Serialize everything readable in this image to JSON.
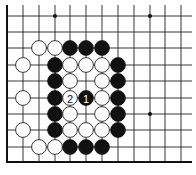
{
  "board": {
    "title": "Go problem diagram",
    "colors": {
      "black": "#111111",
      "white": "#ffffff",
      "line": "#222222",
      "background": "#ffffff"
    },
    "columns_x": [
      7,
      23,
      39,
      55,
      70,
      86,
      102,
      118,
      134,
      150,
      165,
      181
    ],
    "rows_y": [
      16,
      32,
      48,
      65,
      81,
      98,
      114,
      130,
      147
    ],
    "edges": {
      "left": true,
      "bottom": true,
      "top": false,
      "right": false
    },
    "star_points": [
      {
        "col": 3,
        "row": 0
      },
      {
        "col": 9,
        "row": 0
      },
      {
        "col": 9,
        "row": 6
      }
    ],
    "stones": [
      {
        "color": "white",
        "col": 2,
        "row": 2
      },
      {
        "color": "white",
        "col": 3,
        "row": 2
      },
      {
        "color": "black",
        "col": 4,
        "row": 2
      },
      {
        "color": "black",
        "col": 5,
        "row": 2
      },
      {
        "color": "black",
        "col": 6,
        "row": 2
      },
      {
        "color": "white",
        "col": 1,
        "row": 3
      },
      {
        "color": "black",
        "col": 3,
        "row": 3
      },
      {
        "color": "white",
        "col": 4,
        "row": 3
      },
      {
        "color": "white",
        "col": 5,
        "row": 3
      },
      {
        "color": "white",
        "col": 6,
        "row": 3
      },
      {
        "color": "black",
        "col": 7,
        "row": 3
      },
      {
        "color": "black",
        "col": 3,
        "row": 4
      },
      {
        "color": "white",
        "col": 4,
        "row": 4
      },
      {
        "color": "white",
        "col": 6,
        "row": 4
      },
      {
        "color": "black",
        "col": 7,
        "row": 4
      },
      {
        "color": "white",
        "col": 1,
        "row": 5
      },
      {
        "color": "black",
        "col": 3,
        "row": 5
      },
      {
        "color": "white",
        "col": 4,
        "row": 5,
        "label": "2"
      },
      {
        "color": "black",
        "col": 5,
        "row": 5,
        "label": "1"
      },
      {
        "color": "white",
        "col": 6,
        "row": 5
      },
      {
        "color": "black",
        "col": 7,
        "row": 5
      },
      {
        "color": "black",
        "col": 3,
        "row": 6
      },
      {
        "color": "white",
        "col": 4,
        "row": 6
      },
      {
        "color": "white",
        "col": 6,
        "row": 6
      },
      {
        "color": "black",
        "col": 7,
        "row": 6
      },
      {
        "color": "white",
        "col": 1,
        "row": 7
      },
      {
        "color": "black",
        "col": 3,
        "row": 7
      },
      {
        "color": "white",
        "col": 4,
        "row": 7
      },
      {
        "color": "white",
        "col": 5,
        "row": 7
      },
      {
        "color": "white",
        "col": 6,
        "row": 7
      },
      {
        "color": "black",
        "col": 7,
        "row": 7
      },
      {
        "color": "white",
        "col": 2,
        "row": 8
      },
      {
        "color": "white",
        "col": 3,
        "row": 8
      },
      {
        "color": "black",
        "col": 4,
        "row": 8
      },
      {
        "color": "black",
        "col": 5,
        "row": 8
      },
      {
        "color": "black",
        "col": 6,
        "row": 8
      }
    ],
    "move_labels": [
      {
        "label": "1",
        "color": "black"
      },
      {
        "label": "2",
        "color": "white"
      }
    ]
  }
}
